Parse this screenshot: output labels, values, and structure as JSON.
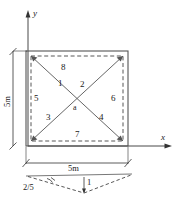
{
  "figure": {
    "axes": {
      "x_label": "x",
      "y_label": "y"
    },
    "dimensions": {
      "horizontal": "5m",
      "vertical": "5m"
    },
    "center_node": "a",
    "element_labels": {
      "n1": "1",
      "n2": "2",
      "n3": "3",
      "n4": "4",
      "n5": "5",
      "n6": "6",
      "n7": "7",
      "n8": "8"
    },
    "detail": {
      "slope_label": "2/5",
      "depth_label": "1"
    },
    "colors": {
      "line": "#333333",
      "text": "#1a1a1a",
      "background": "#ffffff"
    }
  }
}
